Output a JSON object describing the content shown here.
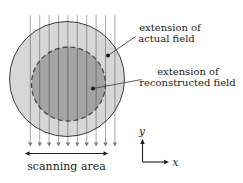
{
  "figure": {
    "labels": {
      "actual_field": {
        "line1": "extension of",
        "line2": "actual field"
      },
      "reconstructed_field": {
        "line1": "extension of",
        "line2": "reconstructed field"
      },
      "scanning_area": "scanning area",
      "axis_x": "x",
      "axis_y": "y"
    },
    "colors": {
      "background": "#ffffff",
      "actual_field_fill": "#d7d7d7",
      "reconstructed_field_fill": "#a4a4a4",
      "outline": "#3c3c3c"
    },
    "scan_lines": {
      "count": 10
    }
  }
}
